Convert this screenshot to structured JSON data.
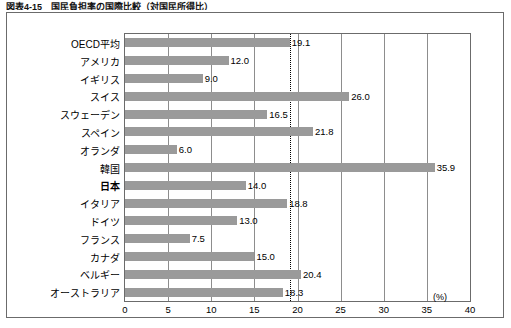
{
  "caption": "図表4-15　国民負担率の国際比較（対国民所得比）",
  "axis_unit": "(%)",
  "chart_data": {
    "type": "bar",
    "orientation": "horizontal",
    "title": "図表4-15　国民負担率の国際比較（対国民所得比）",
    "xlabel": "(%)",
    "ylabel": "",
    "xlim": [
      0,
      40
    ],
    "xticks": [
      0,
      5,
      10,
      15,
      20,
      25,
      30,
      35,
      40
    ],
    "grid": true,
    "reference_line": {
      "value": 19.1,
      "style": "dotted",
      "label": "OECD平均"
    },
    "categories": [
      "OECD平均",
      "アメリカ",
      "イギリス",
      "スイス",
      "スウェーデン",
      "スペイン",
      "オランダ",
      "韓国",
      "日本",
      "イタリア",
      "ドイツ",
      "フランス",
      "カナダ",
      "ベルギー",
      "オーストラリア"
    ],
    "values": [
      19.1,
      12.0,
      9.0,
      26.0,
      16.5,
      21.8,
      6.0,
      35.9,
      14.0,
      18.8,
      13.0,
      7.5,
      15.0,
      20.4,
      18.3
    ],
    "value_labels": [
      "19.1",
      "12.0",
      "9.0",
      "26.0",
      "16.5",
      "21.8",
      "6.0",
      "35.9",
      "14.0",
      "18.8",
      "13.0",
      "7.5",
      "15.0",
      "20.4",
      "18.3"
    ],
    "highlight_category": "日本",
    "bar_color": "#9a9a9a"
  }
}
